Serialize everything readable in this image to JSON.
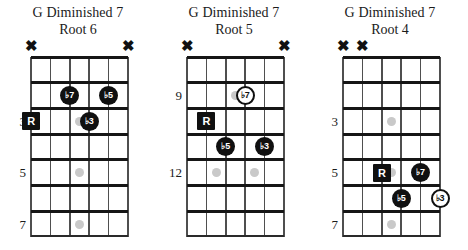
{
  "page": {
    "background": "#ffffff",
    "instrument": "guitar",
    "diagram_count": 3
  },
  "style": {
    "marker_fill_color": "#101010",
    "marker_text_color": "#ffffff",
    "open_marker_border_color": "#101010",
    "open_marker_text_color": "#101010",
    "fret_line_color": "#161616",
    "string_line_color": "#4f4f4f",
    "inlay_dot_color": "#c9c9c9",
    "mute_marker": "✖"
  },
  "diagrams": [
    {
      "id": "root-6",
      "title": "G Diminished 7",
      "subtitle": "Root 6",
      "strings": 6,
      "frets": 7,
      "fret_numbers": [
        {
          "label": "3",
          "row": 3
        },
        {
          "label": "5",
          "row": 5
        },
        {
          "label": "7",
          "row": 7
        }
      ],
      "muted_strings": [
        6,
        1
      ],
      "inlays": [
        {
          "row": 3,
          "between_strings": [
            4,
            3
          ]
        },
        {
          "row": 5,
          "between_strings": [
            4,
            3
          ]
        },
        {
          "row": 7,
          "between_strings": [
            4,
            3
          ]
        }
      ],
      "markers": [
        {
          "label": "R",
          "string": 6,
          "row": 3,
          "shape": "filled-square"
        },
        {
          "label": "♭7",
          "string": 4,
          "row": 2,
          "shape": "filled-circle"
        },
        {
          "label": "♭5",
          "string": 2,
          "row": 2,
          "shape": "filled-circle"
        },
        {
          "label": "♭3",
          "string": 3,
          "row": 3,
          "shape": "filled-circle"
        }
      ]
    },
    {
      "id": "root-5",
      "title": "G Diminished 7",
      "subtitle": "Root 5",
      "strings": 6,
      "frets": 7,
      "fret_numbers": [
        {
          "label": "9",
          "row": 2
        },
        {
          "label": "12",
          "row": 5
        }
      ],
      "muted_strings": [
        6,
        1
      ],
      "inlays": [
        {
          "row": 2,
          "between_strings": [
            4,
            3
          ]
        },
        {
          "row": 5,
          "between_strings": [
            5,
            4
          ]
        },
        {
          "row": 5,
          "between_strings": [
            3,
            2
          ]
        }
      ],
      "markers": [
        {
          "label": "♭7",
          "string": 3,
          "row": 2,
          "shape": "open-circle"
        },
        {
          "label": "R",
          "string": 5,
          "row": 3,
          "shape": "filled-square"
        },
        {
          "label": "♭5",
          "string": 4,
          "row": 4,
          "shape": "filled-circle"
        },
        {
          "label": "♭3",
          "string": 2,
          "row": 4,
          "shape": "filled-circle"
        }
      ]
    },
    {
      "id": "root-4",
      "title": "G Diminished 7",
      "subtitle": "Root 4",
      "strings": 6,
      "frets": 7,
      "fret_numbers": [
        {
          "label": "3",
          "row": 3
        },
        {
          "label": "5",
          "row": 5
        },
        {
          "label": "7",
          "row": 7
        }
      ],
      "muted_strings": [
        6,
        5
      ],
      "inlays": [
        {
          "row": 3,
          "between_strings": [
            4,
            3
          ]
        },
        {
          "row": 5,
          "between_strings": [
            4,
            3
          ]
        },
        {
          "row": 7,
          "between_strings": [
            4,
            3
          ]
        }
      ],
      "markers": [
        {
          "label": "R",
          "string": 4,
          "row": 5,
          "shape": "filled-square"
        },
        {
          "label": "♭7",
          "string": 2,
          "row": 5,
          "shape": "filled-circle"
        },
        {
          "label": "♭5",
          "string": 3,
          "row": 6,
          "shape": "filled-circle"
        },
        {
          "label": "♭3",
          "string": 1,
          "row": 6,
          "shape": "open-circle"
        }
      ]
    }
  ]
}
